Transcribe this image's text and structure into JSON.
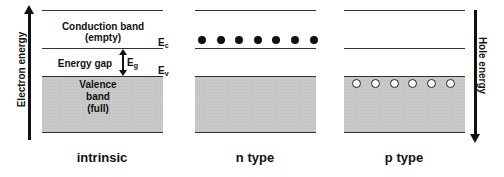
{
  "axes": {
    "left_label": "Electron energy",
    "right_label": "Hole energy"
  },
  "intrinsic": {
    "panel_label": "intrinsic",
    "conduction_band_line1": "Conduction band",
    "conduction_band_line2": "(empty)",
    "energy_gap": "Energy gap",
    "eg_label": "E",
    "eg_sub": "g",
    "ec_label": "E",
    "ec_sub": "c",
    "ev_label": "E",
    "ev_sub": "v",
    "valence_line1": "Valence",
    "valence_line2": "band",
    "valence_line3": "(full)"
  },
  "n_type": {
    "panel_label": "n type",
    "electron_count": 7
  },
  "p_type": {
    "panel_label": "p type",
    "hole_count": 6
  },
  "colors": {
    "band_fill": "#c8c8c8",
    "line": "#333333",
    "electron": "#111111",
    "hole_fill": "#ffffff"
  }
}
